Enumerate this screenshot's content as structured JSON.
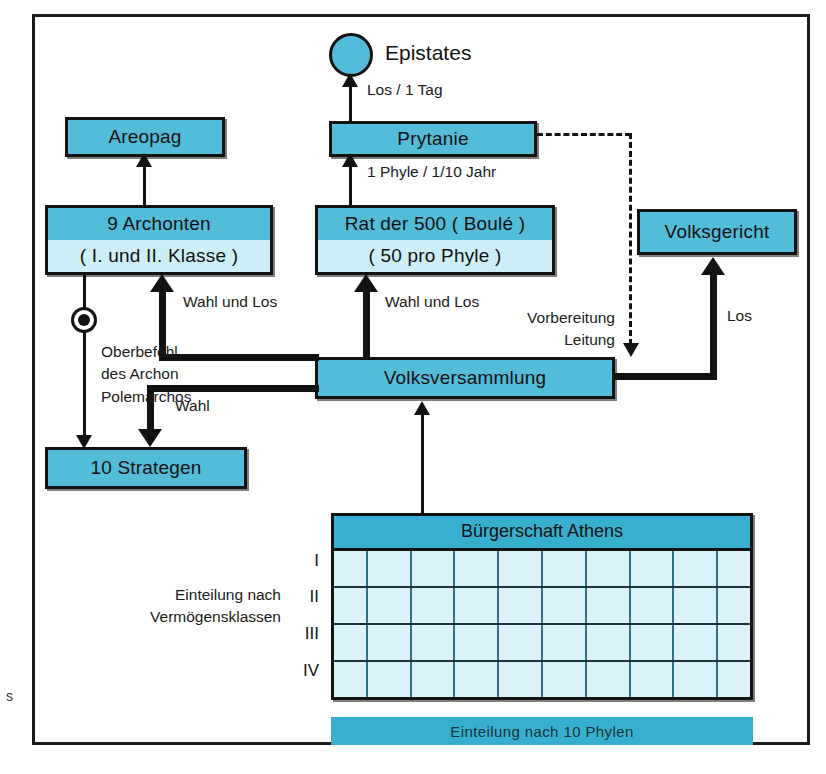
{
  "diagram": {
    "colors": {
      "node_fill": "#53bcd8",
      "node_fill_light": "#cdeef6",
      "table_fill": "#ddf2f8",
      "band_fill": "#39afcf",
      "stroke": "#121212"
    }
  },
  "nodes": {
    "epistates": {
      "label": "Epistates"
    },
    "prytanie": {
      "label": "Prytanie"
    },
    "areopag": {
      "label": "Areopag"
    },
    "archonten": {
      "label_top": "9 Archonten",
      "label_bottom": "( I. und II. Klasse )"
    },
    "rat": {
      "label_top": "Rat der 500 ( Boulé )",
      "label_bottom": "( 50 pro Phyle )"
    },
    "volksgericht": {
      "label": "Volksgericht"
    },
    "volksversammlung": {
      "label": "Volksversammlung"
    },
    "strategen": {
      "label": "10 Strategen"
    },
    "buergerschaft": {
      "label": "Bürgerschaft Athens"
    },
    "phylen_bar": {
      "label": "Einteilung nach 10 Phylen"
    }
  },
  "edge_labels": {
    "los_1_tag": "Los / 1 Tag",
    "phyle_jahr": "1 Phyle / 1/10 Jahr",
    "wahl_und_los_left": "Wahl und Los",
    "wahl_und_los_right": "Wahl und Los",
    "vorbereitung": "Vorbereitung",
    "leitung": "Leitung",
    "los_right": "Los",
    "wahl": "Wahl",
    "oberbefehl_line1": "Oberbefehl",
    "oberbefehl_line2": "des Archon",
    "oberbefehl_line3": "Polemarchos"
  },
  "side_labels": {
    "einteilung_line1": "Einteilung nach",
    "einteilung_line2": "Vermögensklassen"
  },
  "table": {
    "rows": [
      "I",
      "II",
      "III",
      "IV"
    ],
    "columns": 10
  },
  "page_bleed": {
    "char": "s"
  }
}
